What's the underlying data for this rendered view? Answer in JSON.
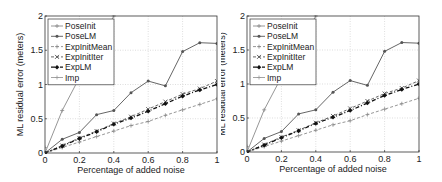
{
  "chart_data": [
    {
      "type": "line",
      "title": "",
      "xlabel": "Percentage of added noise",
      "ylabel": "ML residual error (meters)",
      "xlim": [
        0,
        1
      ],
      "ylim": [
        0,
        2
      ],
      "xticks": [
        "0",
        "0.2",
        "0.4",
        "0.6",
        "0.8",
        "1"
      ],
      "yticks": [
        "0",
        "0.5",
        "1",
        "1.5",
        "2"
      ],
      "grid": true,
      "legend_position": "upper left",
      "x": [
        0,
        0.1,
        0.2,
        0.3,
        0.4,
        0.5,
        0.6,
        0.7,
        0.8,
        0.9,
        1.0
      ],
      "series": [
        {
          "name": "PoseInit",
          "style": "solid",
          "marker": "+",
          "color": "#8a8a8a",
          "x": [
            0,
            0.1,
            0.2,
            0.3,
            0.4
          ],
          "values": [
            0.0,
            0.62,
            1.1,
            1.55,
            2.0
          ]
        },
        {
          "name": "PoseLM",
          "style": "solid",
          "marker": "*",
          "color": "#555555",
          "values": [
            0.0,
            0.2,
            0.3,
            0.56,
            0.62,
            0.88,
            1.05,
            0.98,
            1.48,
            1.61,
            1.6
          ]
        },
        {
          "name": "ExpInitMean",
          "style": "dashed",
          "marker": "+",
          "color": "#8a8a8a",
          "values": [
            0.0,
            0.08,
            0.16,
            0.24,
            0.32,
            0.4,
            0.46,
            0.55,
            0.63,
            0.71,
            0.79
          ]
        },
        {
          "name": "ExpInitIter",
          "style": "dashed",
          "marker": "x",
          "color": "#555555",
          "values": [
            0.0,
            0.11,
            0.22,
            0.32,
            0.43,
            0.53,
            0.64,
            0.75,
            0.86,
            0.94,
            1.05
          ]
        },
        {
          "name": "ExpLM",
          "style": "dash-dot",
          "marker": "diamond",
          "color": "#111111",
          "values": [
            0.0,
            0.1,
            0.21,
            0.31,
            0.42,
            0.51,
            0.61,
            0.72,
            0.83,
            0.92,
            1.0
          ]
        },
        {
          "name": "Imp",
          "style": "solid",
          "marker": "+",
          "color": "#9a9a9a",
          "x": [
            0
          ],
          "values": [
            0.08
          ]
        }
      ]
    },
    {
      "type": "line",
      "title": "",
      "xlabel": "Percentage of added noise",
      "ylabel": "ML residual error (meters)",
      "xlim": [
        0,
        1
      ],
      "ylim": [
        0,
        2
      ],
      "xticks": [
        "0",
        "0.2",
        "0.4",
        "0.6",
        "0.8",
        "1"
      ],
      "yticks": [
        "0",
        "0.5",
        "1",
        "1.5",
        "2"
      ],
      "grid": true,
      "legend_position": "upper left",
      "x": [
        0,
        0.1,
        0.2,
        0.3,
        0.4,
        0.5,
        0.6,
        0.7,
        0.8,
        0.9,
        1.0
      ],
      "series": [
        {
          "name": "PoseInit",
          "style": "solid",
          "marker": "+",
          "color": "#8a8a8a",
          "x": [
            0,
            0.1,
            0.2,
            0.3,
            0.4
          ],
          "values": [
            0.0,
            0.62,
            1.1,
            1.55,
            2.0
          ]
        },
        {
          "name": "PoseLM",
          "style": "solid",
          "marker": "*",
          "color": "#555555",
          "values": [
            0.0,
            0.2,
            0.3,
            0.56,
            0.62,
            0.88,
            1.05,
            0.98,
            1.48,
            1.61,
            1.6
          ]
        },
        {
          "name": "ExpInitMean",
          "style": "dashed",
          "marker": "+",
          "color": "#8a8a8a",
          "values": [
            0.0,
            0.08,
            0.16,
            0.24,
            0.32,
            0.4,
            0.46,
            0.55,
            0.63,
            0.71,
            0.79
          ]
        },
        {
          "name": "ExpInitIter",
          "style": "dashed",
          "marker": "x",
          "color": "#555555",
          "values": [
            0.0,
            0.11,
            0.22,
            0.32,
            0.43,
            0.53,
            0.64,
            0.75,
            0.86,
            0.94,
            1.05
          ]
        },
        {
          "name": "ExpLM",
          "style": "dash-dot",
          "marker": "diamond",
          "color": "#111111",
          "values": [
            0.0,
            0.1,
            0.21,
            0.31,
            0.42,
            0.51,
            0.61,
            0.72,
            0.83,
            0.92,
            1.0
          ]
        },
        {
          "name": "Imp",
          "style": "solid",
          "marker": "+",
          "color": "#9a9a9a",
          "x": [
            0
          ],
          "values": [
            0.08
          ]
        }
      ]
    }
  ],
  "charts": [
    {
      "xlabel": "Percentage of added noise",
      "ylabel": "ML residual error (meters)",
      "xticks": [
        "0",
        "0.2",
        "0.4",
        "0.6",
        "0.8",
        "1"
      ],
      "yticks": [
        "0",
        "0.5",
        "1",
        "1.5",
        "2"
      ],
      "legend": [
        "PoseInit",
        "PoseLM",
        "ExpInitMean",
        "ExpInitIter",
        "ExpLM",
        "Imp"
      ]
    },
    {
      "xlabel": "Percentage of added noise",
      "ylabel": "ML residual error (meters)",
      "xticks": [
        "0",
        "0.2",
        "0.4",
        "0.6",
        "0.8",
        "1"
      ],
      "yticks": [
        "0",
        "0.5",
        "1",
        "1.5",
        "2"
      ],
      "legend": [
        "PoseInit",
        "PoseLM",
        "ExpInitMean",
        "ExpInitIter",
        "ExpLM",
        "Imp"
      ]
    }
  ]
}
